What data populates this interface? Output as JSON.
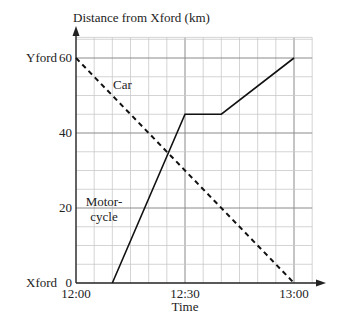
{
  "chart_data": {
    "type": "line",
    "title": "",
    "ylabel": "Distance from Xford (km)",
    "xlabel": "Time",
    "xlim": [
      "12:00",
      "13:00"
    ],
    "ylim": [
      0,
      65
    ],
    "grid": true,
    "x_ticks": [
      "12:00",
      "12:30",
      "13:00"
    ],
    "y_ticks": [
      0,
      20,
      40,
      60
    ],
    "y_place_labels": {
      "0": "Xford",
      "60": "Yford"
    },
    "series": [
      {
        "name": "Car",
        "style": "dashed",
        "points": [
          {
            "time": "12:00",
            "distance_km": 60
          },
          {
            "time": "13:00",
            "distance_km": 0
          }
        ]
      },
      {
        "name": "Motorcycle",
        "style": "solid",
        "points": [
          {
            "time": "12:10",
            "distance_km": 0
          },
          {
            "time": "12:30",
            "distance_km": 45
          },
          {
            "time": "12:40",
            "distance_km": 45
          },
          {
            "time": "13:00",
            "distance_km": 60
          }
        ]
      }
    ],
    "annotations": [
      "Car",
      "Motor-cycle"
    ]
  },
  "labels": {
    "y_axis_title": "Distance from Xford (km)",
    "x_axis_title": "Time",
    "x_tick_0": "12:00",
    "x_tick_30": "12:30",
    "x_tick_60": "13:00",
    "y_tick_0": "0",
    "y_tick_20": "20",
    "y_tick_40": "40",
    "y_tick_60": "60",
    "place_x": "Xford",
    "place_y": "Yford",
    "car_label": "Car",
    "moto_label_1": "Motor-",
    "moto_label_2": "cycle"
  },
  "colors": {
    "line": "#111111",
    "grid_minor": "#c9c9c9",
    "grid_major": "#8a8a8a"
  }
}
